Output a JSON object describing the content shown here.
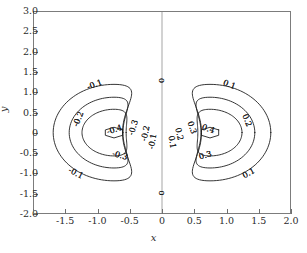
{
  "chart_data": {
    "type": "contour",
    "title": "",
    "xlabel": "x",
    "ylabel": "y",
    "xlim": [
      -2.0,
      2.0
    ],
    "ylim": [
      -2.0,
      3.0
    ],
    "grid": false,
    "legend": "none",
    "xticks": [
      -2.0,
      -1.5,
      -1.0,
      -0.5,
      0,
      0.5,
      1.0,
      1.5,
      2.0
    ],
    "xticklabels": [
      "",
      "-1.5",
      "-1.0",
      "-0.5",
      "0",
      "0.5",
      "1.0",
      "1.5",
      "2.0"
    ],
    "yticks": [
      -2.0,
      -1.5,
      -1.0,
      -0.5,
      0,
      0.5,
      1.0,
      1.5,
      2.0,
      2.5,
      3.0
    ],
    "yticklabels": [
      "-2.0",
      "-1.5",
      "-1.0",
      "-0.5",
      "0",
      "0.5",
      "1.0",
      "1.5",
      "2.0",
      "2.5",
      "3.0"
    ],
    "levels": [
      -0.4,
      -0.3,
      -0.2,
      -0.1,
      0,
      0.1,
      0.2,
      0.3,
      0.4
    ],
    "level_labels": [
      "-0.4",
      "-0.3",
      "-0.2",
      "-0.1",
      "0",
      "0.1",
      "0.2",
      "0.3",
      "0.4"
    ],
    "extrema": [
      {
        "label": "-0.4",
        "x": -0.75,
        "y": 0.0,
        "sign": "negative"
      },
      {
        "label": "0.4",
        "x": 0.75,
        "y": 0.0,
        "sign": "positive"
      }
    ],
    "contour_labels": [
      {
        "text": "-0.1",
        "x": -1.05,
        "y": 1.18,
        "rot": -20
      },
      {
        "text": "-0.2",
        "x": -1.3,
        "y": 0.33,
        "rot": -68
      },
      {
        "text": "-0.4",
        "x": -0.74,
        "y": 0.06,
        "rot": -18
      },
      {
        "text": "-0.3",
        "x": -0.44,
        "y": 0.12,
        "rot": -72
      },
      {
        "text": "-0.2",
        "x": -0.25,
        "y": -0.02,
        "rot": -78
      },
      {
        "text": "-0.1",
        "x": -0.14,
        "y": -0.22,
        "rot": -80
      },
      {
        "text": "-0.3",
        "x": -0.66,
        "y": -0.58,
        "rot": 16
      },
      {
        "text": "-0.1",
        "x": -1.35,
        "y": -1.02,
        "rot": 28
      },
      {
        "text": "0",
        "x": 0.0,
        "y": 1.3,
        "rot": -90
      },
      {
        "text": "0",
        "x": 0.0,
        "y": -1.5,
        "rot": -90
      },
      {
        "text": "0.1",
        "x": 1.05,
        "y": 1.18,
        "rot": 20
      },
      {
        "text": "0.2",
        "x": 1.32,
        "y": 0.3,
        "rot": 68
      },
      {
        "text": "0.4",
        "x": 0.72,
        "y": 0.08,
        "rot": 18
      },
      {
        "text": "0.3",
        "x": 0.46,
        "y": 0.12,
        "rot": 72
      },
      {
        "text": "0.2",
        "x": 0.26,
        "y": -0.04,
        "rot": 78
      },
      {
        "text": "0.1",
        "x": 0.15,
        "y": -0.24,
        "rot": 80
      },
      {
        "text": "0.3",
        "x": 0.68,
        "y": -0.58,
        "rot": -16
      },
      {
        "text": "0.1",
        "x": 1.36,
        "y": -1.02,
        "rot": -28
      }
    ]
  },
  "axes": {
    "x_title": "x",
    "y_title": "y"
  }
}
